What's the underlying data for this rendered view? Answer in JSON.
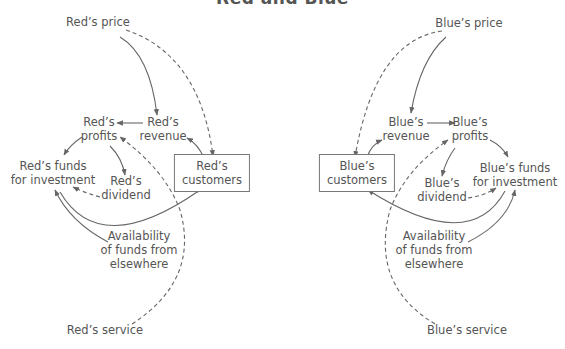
{
  "title": "Red and Blue",
  "left_diagram": {
    "price": "Red’s price",
    "revenue": [
      "Red’s",
      "revenue"
    ],
    "profits": [
      "Red’s",
      "profits"
    ],
    "funds": [
      "Red’s funds",
      "for investment"
    ],
    "dividend": [
      "Red’s",
      "dividend"
    ],
    "customers": [
      "Red’s",
      "customers"
    ],
    "availability": [
      "Availability",
      "of funds from",
      "elsewhere"
    ],
    "service": "Red’s service"
  },
  "right_diagram": {
    "price": "Blue’s price",
    "revenue": [
      "Blue’s",
      "revenue"
    ],
    "profits": [
      "Blue’s",
      "profits"
    ],
    "funds": [
      "Blue’s funds",
      "for investment"
    ],
    "dividend": [
      "Blue’s",
      "dividend"
    ],
    "customers": [
      "Blue’s",
      "customers"
    ],
    "availability": [
      "Availability",
      "of funds from",
      "elsewhere"
    ],
    "service": "Blue’s service"
  },
  "colors": {
    "line": "#666666",
    "text": "#555555",
    "box_border": "#777777"
  }
}
